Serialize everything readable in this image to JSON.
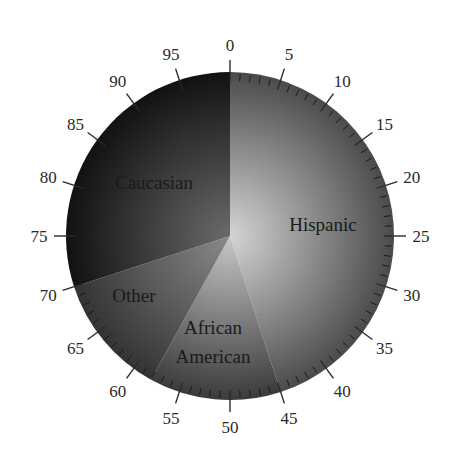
{
  "chart_data": {
    "type": "pie",
    "title": "",
    "scale": {
      "min": 0,
      "max": 100,
      "major_step": 5,
      "minor_step": 1,
      "start": "top",
      "direction": "clockwise"
    },
    "tick_labels": [
      "0",
      "5",
      "10",
      "15",
      "20",
      "25",
      "30",
      "35",
      "40",
      "45",
      "50",
      "55",
      "60",
      "65",
      "70",
      "75",
      "80",
      "85",
      "90",
      "95"
    ],
    "categories": [
      "Hispanic",
      "African American",
      "Other",
      "Caucasian"
    ],
    "values": [
      45,
      13,
      12,
      30
    ],
    "slices": [
      {
        "label": "Hispanic",
        "label_lines": [
          "Hispanic"
        ],
        "start": 0,
        "end": 45,
        "value": 45,
        "color_inner": "#d4d4d4",
        "color_outer": "#4a4a4a"
      },
      {
        "label": "African American",
        "label_lines": [
          "African",
          "American"
        ],
        "start": 45,
        "end": 58,
        "value": 13,
        "color_inner": "#c8c8c8",
        "color_outer": "#3a3a3a"
      },
      {
        "label": "Other",
        "label_lines": [
          "Other"
        ],
        "start": 58,
        "end": 70,
        "value": 12,
        "color_inner": "#8a8a8a",
        "color_outer": "#333333"
      },
      {
        "label": "Caucasian",
        "label_lines": [
          "Caucasian"
        ],
        "start": 70,
        "end": 100,
        "value": 30,
        "color_inner": "#6a6a6a",
        "color_outer": "#111111"
      }
    ],
    "legend": "none",
    "grid": false
  }
}
